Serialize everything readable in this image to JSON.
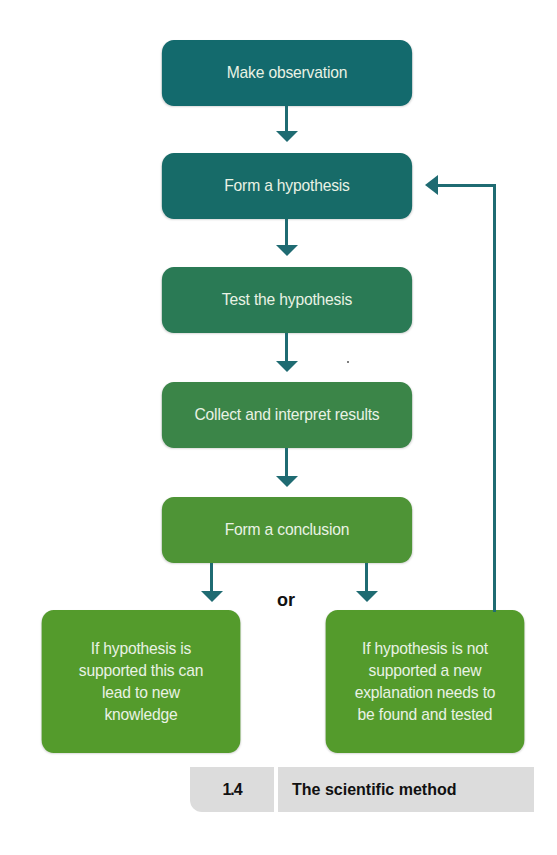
{
  "diagram": {
    "title": "The scientific method",
    "figure_number": "1.4",
    "steps": [
      {
        "label": "Make observation",
        "color": "#136a6d"
      },
      {
        "label": "Form a hypothesis",
        "color": "#176b68"
      },
      {
        "label": "Test the hypothesis",
        "color": "#2a7a55"
      },
      {
        "label": "Collect and interpret results",
        "color": "#3b8548"
      },
      {
        "label": "Form a conclusion",
        "color": "#4e9436"
      }
    ],
    "connector_label": "or",
    "outcomes": [
      {
        "lines": [
          "If hypothesis is",
          "supported this can",
          "lead to new",
          "knowledge"
        ],
        "color": "#549b2c"
      },
      {
        "lines": [
          "If hypothesis is not",
          "supported a new",
          "explanation needs to",
          "be found and tested"
        ],
        "color": "#549b2c"
      }
    ],
    "arrow_color": "#1f6b72",
    "feedback_arrow": {
      "from": "outcome-not-supported",
      "to": "Form a hypothesis"
    }
  }
}
